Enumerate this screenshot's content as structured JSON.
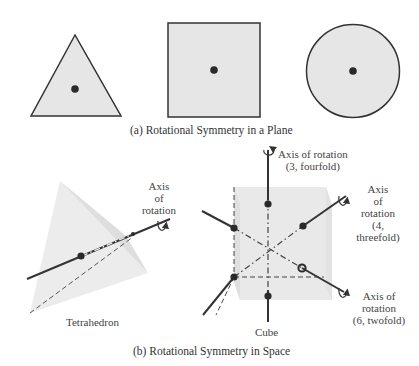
{
  "part_a": {
    "caption": "(a)  Rotational Symmetry in a Plane",
    "shapes": [
      "triangle",
      "square",
      "circle"
    ]
  },
  "part_b": {
    "caption": "(b)  Rotational Symmetry in Space",
    "tetrahedron": {
      "name": "Tetrahedron",
      "axis_label_1": "Axis",
      "axis_label_2": "of",
      "axis_label_3": "rotation"
    },
    "cube": {
      "name": "Cube",
      "axis_fourfold_1": "Axis of rotation",
      "axis_fourfold_2": "(3, fourfold)",
      "axis_threefold_1": "Axis",
      "axis_threefold_2": "of",
      "axis_threefold_3": "rotation",
      "axis_threefold_4": "(4,",
      "axis_threefold_5": "threefold)",
      "axis_twofold_1": "Axis of",
      "axis_twofold_2": "rotation",
      "axis_twofold_3": "(6, twofold)"
    }
  },
  "colors": {
    "fill": "#e4e4e4",
    "stroke": "#333333",
    "dot": "#2a2a2a"
  }
}
